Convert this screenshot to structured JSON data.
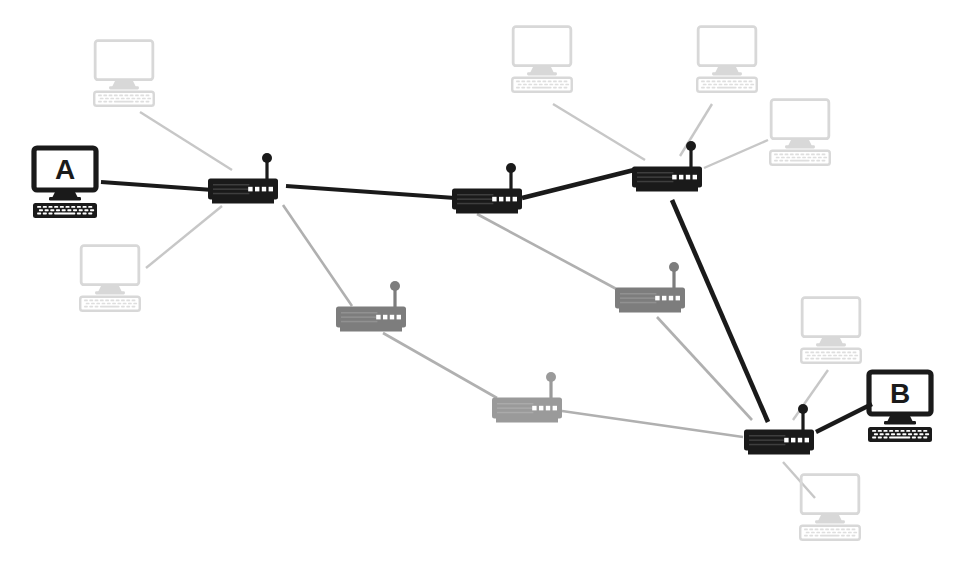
{
  "diagram": {
    "type": "network-topology",
    "width": 971,
    "height": 569,
    "background_color": "#ffffff",
    "colors": {
      "active_dark": "#1a1a1a",
      "inactive_router_gray": "#7d7d7d",
      "inactive_link_gray": "#b0b0b0",
      "inactive_terminal_gray": "#d8d8d8",
      "led_color": "#ffffff"
    },
    "legend_note": "Dark elements show the highlighted path from terminal A to terminal B; light gray elements are inactive nodes and links."
  },
  "terminals": [
    {
      "id": "terminal-a",
      "label": "A",
      "state": "active",
      "color": "#1a1a1a",
      "x": 65,
      "y": 186,
      "scale": 1.0
    },
    {
      "id": "terminal-b",
      "label": "B",
      "state": "active",
      "color": "#1a1a1a",
      "x": 900,
      "y": 410,
      "scale": 1.0
    },
    {
      "id": "terminal-c1",
      "label": "",
      "state": "inactive",
      "color": "#d8d8d8",
      "x": 124,
      "y": 76,
      "scale": 0.93
    },
    {
      "id": "terminal-c2",
      "label": "",
      "state": "inactive",
      "color": "#d8d8d8",
      "x": 110,
      "y": 281,
      "scale": 0.93
    },
    {
      "id": "terminal-c3",
      "label": "",
      "state": "inactive",
      "color": "#d8d8d8",
      "x": 542,
      "y": 62,
      "scale": 0.93
    },
    {
      "id": "terminal-c4",
      "label": "",
      "state": "inactive",
      "color": "#d8d8d8",
      "x": 727,
      "y": 62,
      "scale": 0.93
    },
    {
      "id": "terminal-c5",
      "label": "",
      "state": "inactive",
      "color": "#d8d8d8",
      "x": 800,
      "y": 135,
      "scale": 0.93
    },
    {
      "id": "terminal-c6",
      "label": "",
      "state": "inactive",
      "color": "#d8d8d8",
      "x": 831,
      "y": 333,
      "scale": 0.93
    },
    {
      "id": "terminal-c7",
      "label": "",
      "state": "inactive",
      "color": "#d8d8d8",
      "x": 830,
      "y": 510,
      "scale": 0.93
    }
  ],
  "routers": [
    {
      "id": "router-1",
      "state": "active",
      "color": "#1a1a1a",
      "x": 243,
      "y": 189,
      "led_count": 4
    },
    {
      "id": "router-2",
      "state": "active",
      "color": "#1a1a1a",
      "x": 487,
      "y": 199,
      "led_count": 4
    },
    {
      "id": "router-3",
      "state": "active",
      "color": "#1a1a1a",
      "x": 667,
      "y": 177,
      "led_count": 4
    },
    {
      "id": "router-4",
      "state": "inactive",
      "color": "#7d7d7d",
      "x": 371,
      "y": 317,
      "led_count": 4
    },
    {
      "id": "router-5",
      "state": "inactive",
      "color": "#9a9a9a",
      "x": 527,
      "y": 408,
      "led_count": 4
    },
    {
      "id": "router-6",
      "state": "active",
      "color": "#1a1a1a",
      "x": 779,
      "y": 440,
      "led_count": 4
    },
    {
      "id": "router-7",
      "state": "inactive",
      "color": "#7d7d7d",
      "x": 650,
      "y": 298,
      "led_count": 4
    }
  ],
  "links": [
    {
      "id": "link-a-r1",
      "from": "terminal-a",
      "to": "router-1",
      "state": "active",
      "color": "#1a1a1a",
      "width": 4.2,
      "x1": 101,
      "y1": 182,
      "x2": 213,
      "y2": 190
    },
    {
      "id": "link-r1-r2",
      "from": "router-1",
      "to": "router-2",
      "state": "active",
      "color": "#1a1a1a",
      "width": 4.2,
      "x1": 286,
      "y1": 186,
      "x2": 455,
      "y2": 198
    },
    {
      "id": "link-r2-r3",
      "from": "router-2",
      "to": "router-3",
      "state": "active",
      "color": "#1a1a1a",
      "width": 4.6,
      "x1": 522,
      "y1": 198,
      "x2": 634,
      "y2": 170
    },
    {
      "id": "link-r3-r6",
      "from": "router-3",
      "to": "router-6",
      "state": "active",
      "color": "#1a1a1a",
      "width": 4.6,
      "x1": 672,
      "y1": 200,
      "x2": 768,
      "y2": 422
    },
    {
      "id": "link-r6-b",
      "from": "router-6",
      "to": "terminal-b",
      "state": "active",
      "color": "#1a1a1a",
      "width": 4.2,
      "x1": 816,
      "y1": 432,
      "x2": 872,
      "y2": 404
    },
    {
      "id": "link-r1-r4",
      "from": "router-1",
      "to": "router-4",
      "state": "inactive",
      "color": "#b0b0b0",
      "width": 2.6,
      "x1": 283,
      "y1": 205,
      "x2": 352,
      "y2": 306
    },
    {
      "id": "link-r4-r5",
      "from": "router-4",
      "to": "router-5",
      "state": "inactive",
      "color": "#b0b0b0",
      "width": 2.6,
      "x1": 383,
      "y1": 333,
      "x2": 497,
      "y2": 398
    },
    {
      "id": "link-r5-r6",
      "from": "router-5",
      "to": "router-6",
      "state": "inactive",
      "color": "#b0b0b0",
      "width": 2.6,
      "x1": 562,
      "y1": 411,
      "x2": 743,
      "y2": 437
    },
    {
      "id": "link-r2-r7",
      "from": "router-2",
      "to": "router-7",
      "state": "inactive",
      "color": "#b0b0b0",
      "width": 2.6,
      "x1": 477,
      "y1": 214,
      "x2": 622,
      "y2": 292
    },
    {
      "id": "link-r7-r6",
      "from": "router-7",
      "to": "router-6",
      "state": "inactive",
      "color": "#b0b0b0",
      "width": 2.6,
      "x1": 657,
      "y1": 317,
      "x2": 752,
      "y2": 420
    },
    {
      "id": "link-r3-c5",
      "from": "router-3",
      "to": "terminal-c5",
      "state": "inactive",
      "color": "#c7c7c7",
      "width": 2.4,
      "x1": 704,
      "y1": 168,
      "x2": 768,
      "y2": 140
    },
    {
      "id": "link-r3-c4",
      "from": "router-3",
      "to": "terminal-c4",
      "state": "inactive",
      "color": "#c7c7c7",
      "width": 2.4,
      "x1": 680,
      "y1": 156,
      "x2": 712,
      "y2": 104
    },
    {
      "id": "link-r3-c3",
      "from": "router-3",
      "to": "terminal-c3",
      "state": "inactive",
      "color": "#c7c7c7",
      "width": 2.4,
      "x1": 645,
      "y1": 160,
      "x2": 553,
      "y2": 104
    },
    {
      "id": "link-r1-c1",
      "from": "router-1",
      "to": "terminal-c1",
      "state": "inactive",
      "color": "#c7c7c7",
      "width": 2.4,
      "x1": 232,
      "y1": 170,
      "x2": 140,
      "y2": 112
    },
    {
      "id": "link-r1-c2",
      "from": "router-1",
      "to": "terminal-c2",
      "state": "inactive",
      "color": "#c7c7c7",
      "width": 2.4,
      "x1": 222,
      "y1": 206,
      "x2": 146,
      "y2": 268
    },
    {
      "id": "link-r6-c6",
      "from": "router-6",
      "to": "terminal-c6",
      "state": "inactive",
      "color": "#c7c7c7",
      "width": 2.4,
      "x1": 793,
      "y1": 420,
      "x2": 828,
      "y2": 370
    },
    {
      "id": "link-r6-c7",
      "from": "router-6",
      "to": "terminal-c7",
      "state": "inactive",
      "color": "#c7c7c7",
      "width": 2.4,
      "x1": 783,
      "y1": 462,
      "x2": 815,
      "y2": 498
    }
  ]
}
